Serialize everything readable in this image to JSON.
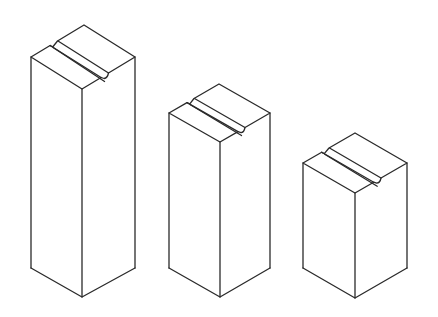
{
  "figure": {
    "stroke_color": "#2a2a2a",
    "background": "#ffffff"
  },
  "blocks": [
    {
      "name": "tall-block",
      "left_x": 31,
      "front_x": 82,
      "right_x": 135,
      "apex_y": 27,
      "shoulder_y": 57,
      "front_top_y": 89,
      "shoulder_bottom_y": 268,
      "front_bottom_y": 297
    },
    {
      "name": "medium-block",
      "left_x": 169,
      "front_x": 220,
      "right_x": 270,
      "apex_y": 83,
      "shoulder_y": 113,
      "front_top_y": 142,
      "shoulder_bottom_y": 268,
      "front_bottom_y": 297
    },
    {
      "name": "short-block",
      "left_x": 303,
      "front_x": 355,
      "right_x": 407,
      "apex_y": 134,
      "shoulder_y": 163,
      "front_top_y": 193,
      "shoulder_bottom_y": 268,
      "front_bottom_y": 298
    }
  ]
}
